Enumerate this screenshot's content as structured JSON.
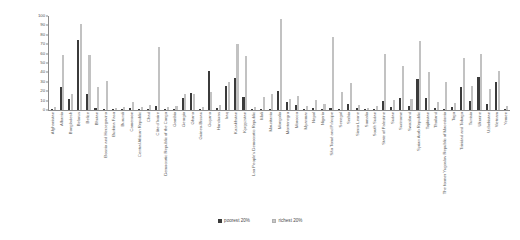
{
  "chart_data": {
    "type": "bar",
    "title": "",
    "subtitle": "",
    "xlabel": "",
    "ylabel": "",
    "ylim": [
      0,
      100
    ],
    "yticks": [
      0,
      10,
      20,
      30,
      40,
      50,
      60,
      70,
      80,
      90,
      100
    ],
    "grid": false,
    "legend_position": "bottom-center",
    "orientation": "vertical",
    "grouping": "grouped",
    "categories": [
      "Afghanistan",
      "Albania",
      "Bangladesh",
      "Belarus",
      "Belize",
      "Bhutan",
      "Bosnia and Herzegovina",
      "Burkina Faso",
      "Burundi",
      "Cameroon",
      "Central African Republic",
      "Chad",
      "Côte d'Ivoire",
      "Democratic Republic of the Congo",
      "Gambia",
      "Georgia",
      "Ghana",
      "Guinea-Bissau",
      "Guyana",
      "Honduras",
      "Iraq",
      "Kazakhstan",
      "Kyrgyzstan",
      "Lao People's Democratic Republic",
      "Mali",
      "Mauritania",
      "Mongolia",
      "Montenegro",
      "Morocco",
      "Myanmar",
      "Nepal",
      "Nigeria",
      "São Tomé and Príncipe",
      "Senegal",
      "Serbia",
      "Sierra Leone",
      "Somalia",
      "South Sudan",
      "State of Palestine",
      "Sudan",
      "Suriname",
      "Swaziland",
      "Syrian Arab Republic",
      "Tajikistan",
      "Thailand",
      "The former Yugoslav Republic of Macedonia",
      "Togo",
      "Trinidad and Tobago",
      "Tunisia",
      "Ukraine",
      "Uzbekistan",
      "Vietnam",
      "Yemen"
    ],
    "series": [
      {
        "name": "poorest 20%",
        "color": "#3b3b3b",
        "values": [
          1,
          25,
          12,
          75,
          17,
          2,
          1,
          1,
          1,
          2,
          1,
          1,
          4,
          1,
          1,
          13,
          18,
          1,
          42,
          2,
          26,
          34,
          14,
          1,
          1,
          1,
          20,
          8,
          5,
          1,
          2,
          1,
          2,
          1,
          6,
          2,
          1,
          1,
          10,
          3,
          13,
          4,
          33,
          13,
          2,
          1,
          3,
          25,
          10,
          35,
          6,
          30,
          1
        ]
      },
      {
        "name": "richest 20%",
        "color": "#c2c2c2",
        "values": [
          3,
          59,
          17,
          91,
          59,
          25,
          31,
          2,
          3,
          9,
          3,
          5,
          67,
          3,
          4,
          17,
          17,
          3,
          19,
          5,
          30,
          70,
          57,
          3,
          14,
          17,
          97,
          12,
          15,
          4,
          11,
          6,
          78,
          19,
          29,
          5,
          2,
          4,
          60,
          11,
          47,
          12,
          73,
          40,
          9,
          30,
          7,
          55,
          26,
          60,
          22,
          42,
          4
        ]
      }
    ],
    "legend": [
      {
        "label": "poorest 20%",
        "marker": "filled-square",
        "color": "#3b3b3b"
      },
      {
        "label": "richest 20%",
        "marker": "light-square",
        "color": "#c8c8c8"
      }
    ]
  }
}
